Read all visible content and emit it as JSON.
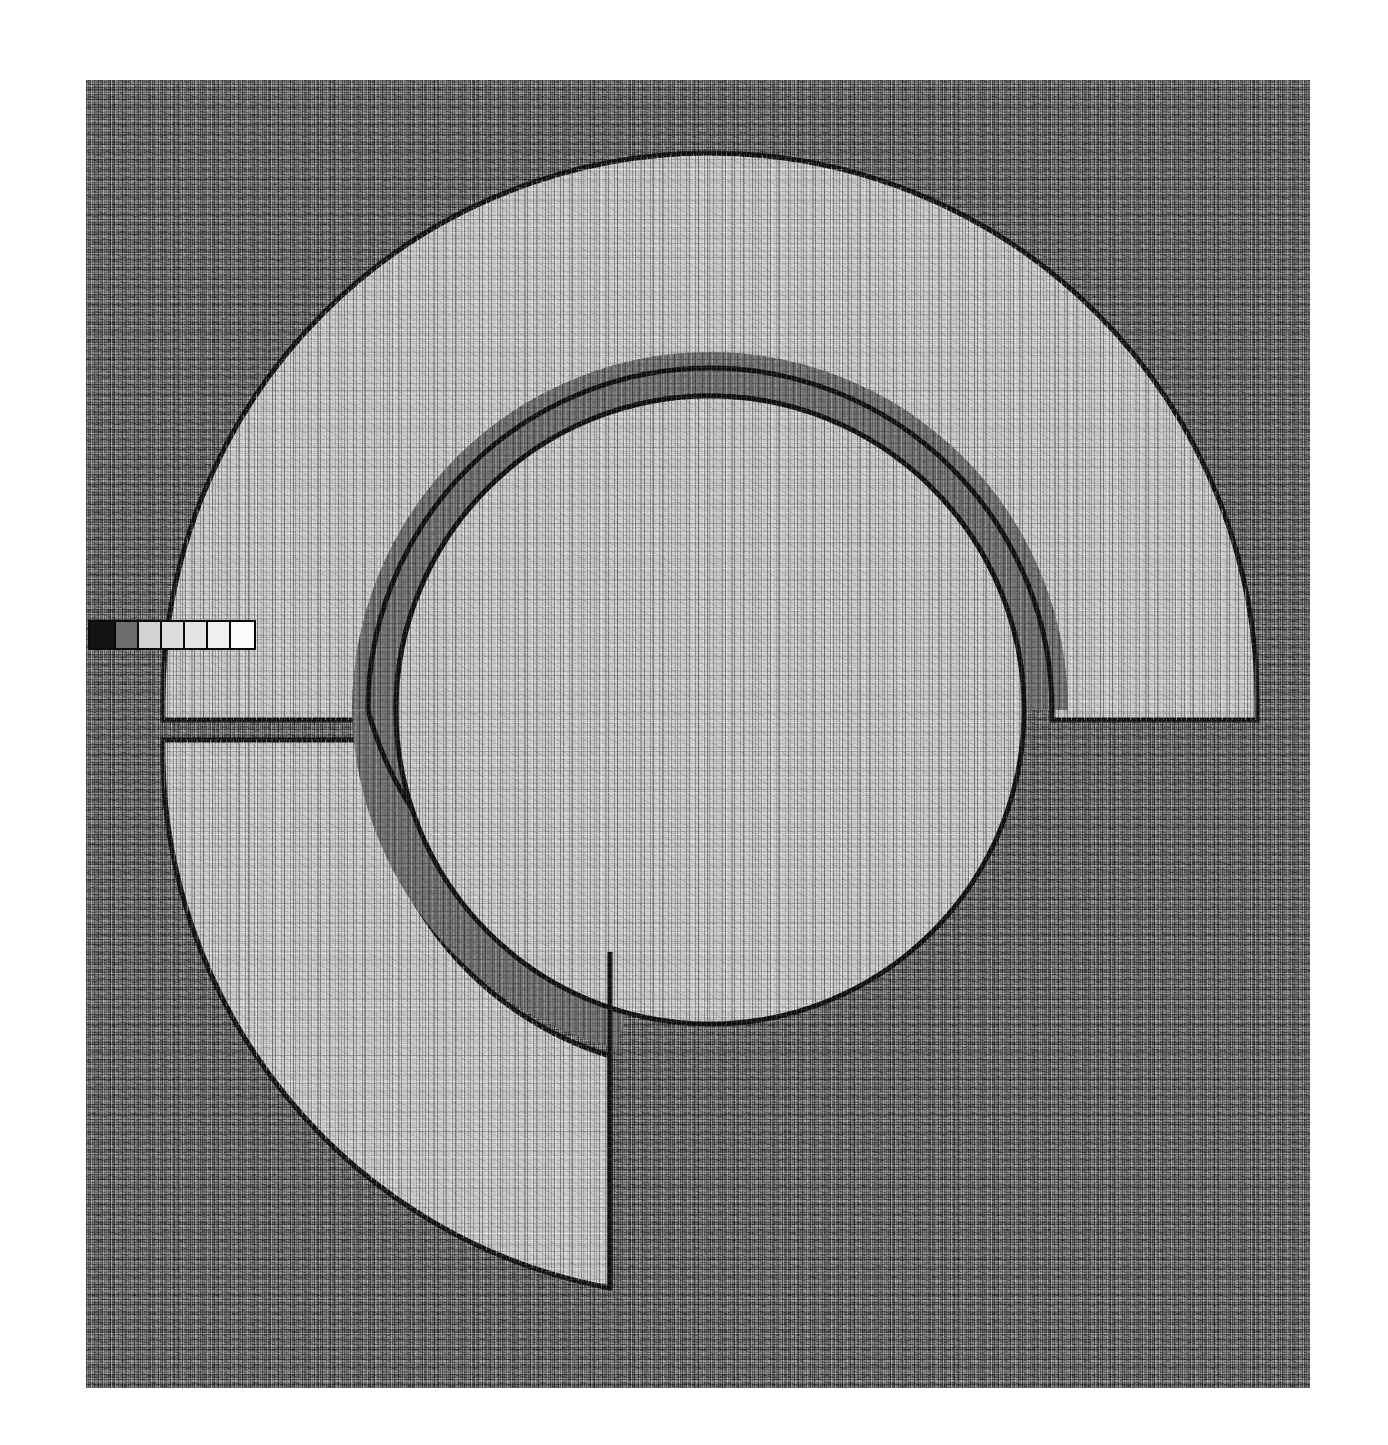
{
  "figure": {
    "kind": "grayscale-micrograph",
    "background_color": "#7e7e7e",
    "feature_fill_color": "#c9c9c9",
    "gap_fill_color": "#6f6f6f",
    "outline_color": "#101010",
    "frame": {
      "x": 86,
      "y": 80,
      "width": 1224,
      "height": 1308
    }
  },
  "geometry": {
    "center": {
      "x": 624,
      "y": 630
    },
    "outer_arc": {
      "name": "outer-c-ring",
      "outer_radius": 547,
      "inner_radius": 330,
      "upper_segment_start_deg": 185,
      "upper_segment_end_deg": 352,
      "lower_segment_start_deg": 8,
      "lower_segment_end_deg": 175
    },
    "gap_band": {
      "name": "annular-gap",
      "outer_radius": 330,
      "inner_radius": 287,
      "fill": "#6f6f6f"
    },
    "inner_disc": {
      "name": "central-disc",
      "radius": 287,
      "fill": "#c9c9c9"
    }
  },
  "scale_bar": {
    "name": "scale-bar",
    "x": 2,
    "y": 540,
    "height": 30,
    "segment_count": 6,
    "segments": [
      {
        "index": 0,
        "color": "#141414",
        "label": "dark"
      },
      {
        "index": 1,
        "color": "#6e6e6e",
        "label": "mid"
      },
      {
        "index": 2,
        "color": "#d2d2d2",
        "label": "light"
      },
      {
        "index": 3,
        "color": "#dcdcdc",
        "label": "light"
      },
      {
        "index": 4,
        "color": "#e4e4e4",
        "label": "light"
      },
      {
        "index": 5,
        "color": "#efefef",
        "label": "light"
      },
      {
        "index": 6,
        "color": "#fbfbfb",
        "label": "white"
      }
    ],
    "border_color": "#0a0a0a"
  },
  "labels": {
    "title": "",
    "caption": "",
    "annotations": []
  }
}
